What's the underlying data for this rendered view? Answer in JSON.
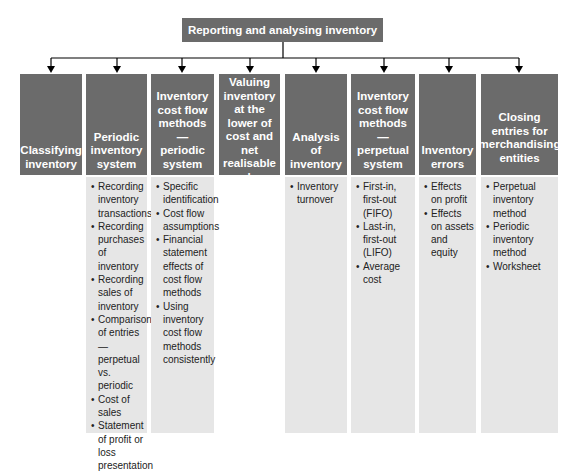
{
  "diagram": {
    "root": {
      "label": "Reporting and analysing inventory"
    },
    "colors": {
      "header_bg": "#6b6b6b",
      "header_text": "#ffffff",
      "body_bg": "#e6e6e6",
      "body_text": "#222222",
      "connector": "#000000"
    },
    "columns": [
      {
        "title": "Classifying inventory",
        "items": []
      },
      {
        "title": "Periodic inventory system",
        "items": [
          "Recording inventory transactions",
          "Recording purchases of inventory",
          "Recording sales of inventory",
          "Comparison of entries — perpetual vs. periodic",
          "Cost of sales",
          "Statement of profit or loss presentation"
        ]
      },
      {
        "title": "Inventory cost flow methods — periodic system",
        "items": [
          "Specific identification",
          "Cost flow assumptions",
          "Financial statement effects of cost flow methods",
          "Using inventory cost flow methods consistently"
        ]
      },
      {
        "title": "Valuing inventory at the lower of cost and net realisable value",
        "items": []
      },
      {
        "title": "Analysis of inventory",
        "items": [
          "Inventory turnover"
        ]
      },
      {
        "title": "Inventory cost flow methods — perpetual system",
        "items": [
          "First-in, first-out (FIFO)",
          "Last-in, first-out (LIFO)",
          "Average cost"
        ]
      },
      {
        "title": "Inventory errors",
        "items": [
          "Effects on profit",
          "Effects on assets and equity"
        ]
      },
      {
        "title": "Closing entries for merchandising entities",
        "items": [
          "Perpetual inventory method",
          "Periodic inventory method",
          "Worksheet"
        ]
      }
    ]
  }
}
